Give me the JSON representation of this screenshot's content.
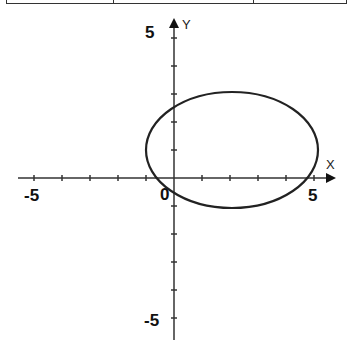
{
  "chart_data": {
    "type": "line",
    "title": "",
    "xlabel": "X",
    "ylabel": "Y",
    "xlim": [
      -5.5,
      5.5
    ],
    "ylim": [
      -5.5,
      5.5
    ],
    "x_ticks": [
      -5,
      -4,
      -3,
      -2,
      -1,
      0,
      1,
      2,
      3,
      4,
      5
    ],
    "y_ticks": [
      -5,
      -4,
      -3,
      -2,
      -1,
      0,
      1,
      2,
      3,
      4,
      5
    ],
    "tick_labels": {
      "x_min": "-5",
      "x_max": "5",
      "y_min": "-5",
      "y_max": "5",
      "origin": "0"
    },
    "grid": false,
    "series": [
      {
        "name": "ellipse",
        "shape": "ellipse",
        "center": [
          2,
          1
        ],
        "semi_axis_x": 3,
        "semi_axis_y": 2,
        "equation": "(x-2)^2/9 + (y-1)^2/4 = 1"
      }
    ]
  },
  "labels": {
    "x_axis": "X",
    "y_axis": "Y",
    "x_min": "-5",
    "x_max": "5",
    "y_min": "-5",
    "y_max": "5",
    "origin": "0"
  }
}
